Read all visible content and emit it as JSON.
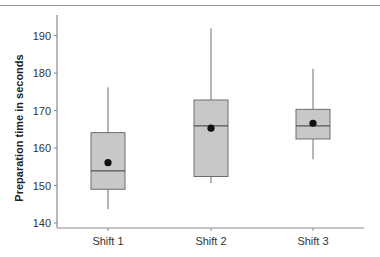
{
  "chart_data": {
    "type": "box",
    "title": "",
    "xlabel": "",
    "ylabel": "Preparation time in seconds",
    "ylim": [
      139,
      195
    ],
    "yticks": [
      140,
      150,
      160,
      170,
      180,
      190
    ],
    "ytick_labels": [
      "140",
      "150",
      "160",
      "170",
      "180",
      "190"
    ],
    "grid": false,
    "legend": null,
    "categories": [
      "Shift 1",
      "Shift 2",
      "Shift 3"
    ],
    "series": [
      {
        "name": "Shift 1",
        "whisker_low": 143.7,
        "q1": 149.0,
        "median": 153.9,
        "q3": 164.1,
        "whisker_high": 176.2,
        "mean": 156.1
      },
      {
        "name": "Shift 2",
        "whisker_low": 150.6,
        "q1": 152.4,
        "median": 165.9,
        "q3": 172.8,
        "whisker_high": 191.9,
        "mean": 165.3
      },
      {
        "name": "Shift 3",
        "whisker_low": 157.0,
        "q1": 162.4,
        "median": 165.9,
        "q3": 170.3,
        "whisker_high": 181.1,
        "mean": 166.6
      }
    ],
    "colors": {
      "box_fill": "#c8c8c8",
      "box_stroke": "#6e6e6e",
      "axis": "#8a8a8a",
      "mean_marker": "#111111"
    }
  }
}
